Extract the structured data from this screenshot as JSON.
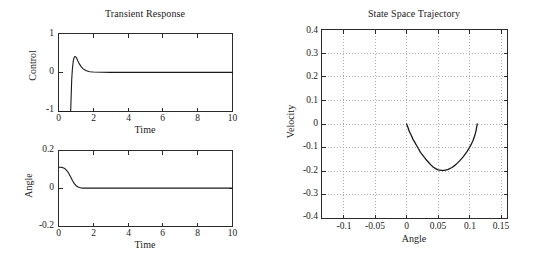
{
  "figure": {
    "background_color": "#ffffff",
    "line_color": "#1a1a1a",
    "grid_color": "#9a9a9a",
    "axis_color": "#2b2b2b"
  },
  "panels": {
    "control": {
      "title": "Transient Response",
      "xlabel": "Time",
      "ylabel": "Control",
      "ytick_labels": [
        "1",
        "0",
        "-1"
      ],
      "xtick_labels": [
        "0",
        "2",
        "4",
        "6",
        "8",
        "10"
      ]
    },
    "angle": {
      "title": "",
      "xlabel": "Time",
      "ylabel": "Angle",
      "ytick_labels": [
        "0.2",
        "0",
        "-0.2"
      ],
      "xtick_labels": [
        "0",
        "2",
        "4",
        "6",
        "8",
        "10"
      ]
    },
    "phase": {
      "title": "State Space Trajectory",
      "xlabel": "Angle",
      "ylabel": "Velocity",
      "ytick_labels": [
        "0.4",
        "0.3",
        "0.2",
        "0.1",
        "0",
        "-0.1",
        "-0.2",
        "-0.3",
        "-0.4"
      ],
      "xtick_labels": [
        "-0.1",
        "-0.05",
        "0",
        "0.05",
        "0.1",
        "0.15"
      ]
    }
  },
  "chart_data": [
    {
      "type": "line",
      "id": "control-vs-time",
      "title": "Transient Response",
      "xlabel": "Time",
      "ylabel": "Control",
      "xlim": [
        0,
        10
      ],
      "ylim": [
        -1,
        1
      ],
      "xticks": [
        0,
        2,
        4,
        6,
        8,
        10
      ],
      "yticks": [
        -1,
        0,
        1
      ],
      "grid": false,
      "legend": null,
      "series": [
        {
          "name": "Control",
          "x": [
            0.0,
            0.15,
            0.3,
            0.45,
            0.6,
            0.68,
            0.7,
            0.72,
            0.76,
            0.8,
            0.85,
            0.9,
            0.95,
            1.0,
            1.05,
            1.1,
            1.2,
            1.3,
            1.4,
            1.5,
            1.6,
            1.7,
            1.8,
            2.0,
            2.5,
            3.0,
            4.0,
            5.0,
            6.0,
            7.0,
            8.0,
            9.0,
            10.0
          ],
          "y": [
            -1.0,
            -1.0,
            -1.0,
            -1.0,
            -1.0,
            -1.0,
            -0.99,
            -0.72,
            -0.18,
            0.1,
            0.3,
            0.39,
            0.41,
            0.4,
            0.36,
            0.31,
            0.22,
            0.15,
            0.1,
            0.07,
            0.045,
            0.03,
            0.02,
            0.012,
            0.005,
            0.003,
            0.002,
            0.002,
            0.002,
            0.002,
            0.002,
            0.002,
            0.002
          ]
        }
      ]
    },
    {
      "type": "line",
      "id": "angle-vs-time",
      "title": "",
      "xlabel": "Time",
      "ylabel": "Angle",
      "xlim": [
        0,
        10
      ],
      "ylim": [
        -0.2,
        0.2
      ],
      "xticks": [
        0,
        2,
        4,
        6,
        8,
        10
      ],
      "yticks": [
        -0.2,
        0,
        0.2
      ],
      "grid": false,
      "legend": null,
      "series": [
        {
          "name": "Angle",
          "x": [
            0.0,
            0.1,
            0.2,
            0.3,
            0.4,
            0.5,
            0.6,
            0.7,
            0.8,
            0.9,
            1.0,
            1.1,
            1.2,
            1.3,
            1.4,
            1.5,
            1.6,
            1.8,
            2.0,
            2.5,
            3.0,
            4.0,
            5.0,
            6.0,
            7.0,
            8.0,
            9.0,
            10.0
          ],
          "y": [
            0.112,
            0.112,
            0.111,
            0.108,
            0.102,
            0.092,
            0.078,
            0.06,
            0.042,
            0.027,
            0.016,
            0.009,
            0.005,
            0.003,
            0.002,
            0.002,
            0.002,
            0.002,
            0.002,
            0.002,
            0.002,
            0.002,
            0.002,
            0.002,
            0.002,
            0.002,
            0.002,
            0.002
          ]
        }
      ]
    },
    {
      "type": "line",
      "id": "state-space-trajectory",
      "title": "State Space Trajectory",
      "xlabel": "Angle",
      "ylabel": "Velocity",
      "xlim": [
        -0.135,
        0.16
      ],
      "ylim": [
        -0.4,
        0.4
      ],
      "xticks": [
        -0.1,
        -0.05,
        0,
        0.05,
        0.1,
        0.15
      ],
      "yticks": [
        -0.4,
        -0.3,
        -0.2,
        -0.1,
        0,
        0.1,
        0.2,
        0.3,
        0.4
      ],
      "grid": true,
      "legend": null,
      "series": [
        {
          "name": "Trajectory",
          "x": [
            0.112,
            0.111,
            0.11,
            0.108,
            0.105,
            0.101,
            0.096,
            0.09,
            0.084,
            0.078,
            0.072,
            0.066,
            0.06,
            0.055,
            0.05,
            0.046,
            0.042,
            0.038,
            0.034,
            0.03,
            0.026,
            0.022,
            0.019,
            0.016,
            0.013,
            0.01,
            0.008,
            0.006,
            0.004,
            0.003,
            0.002,
            0.001,
            0.0
          ],
          "y": [
            0.0,
            -0.014,
            -0.03,
            -0.05,
            -0.072,
            -0.094,
            -0.116,
            -0.138,
            -0.156,
            -0.172,
            -0.184,
            -0.192,
            -0.196,
            -0.196,
            -0.194,
            -0.189,
            -0.182,
            -0.172,
            -0.16,
            -0.148,
            -0.134,
            -0.12,
            -0.106,
            -0.092,
            -0.078,
            -0.064,
            -0.052,
            -0.04,
            -0.03,
            -0.021,
            -0.014,
            -0.007,
            0.0
          ]
        }
      ]
    }
  ]
}
